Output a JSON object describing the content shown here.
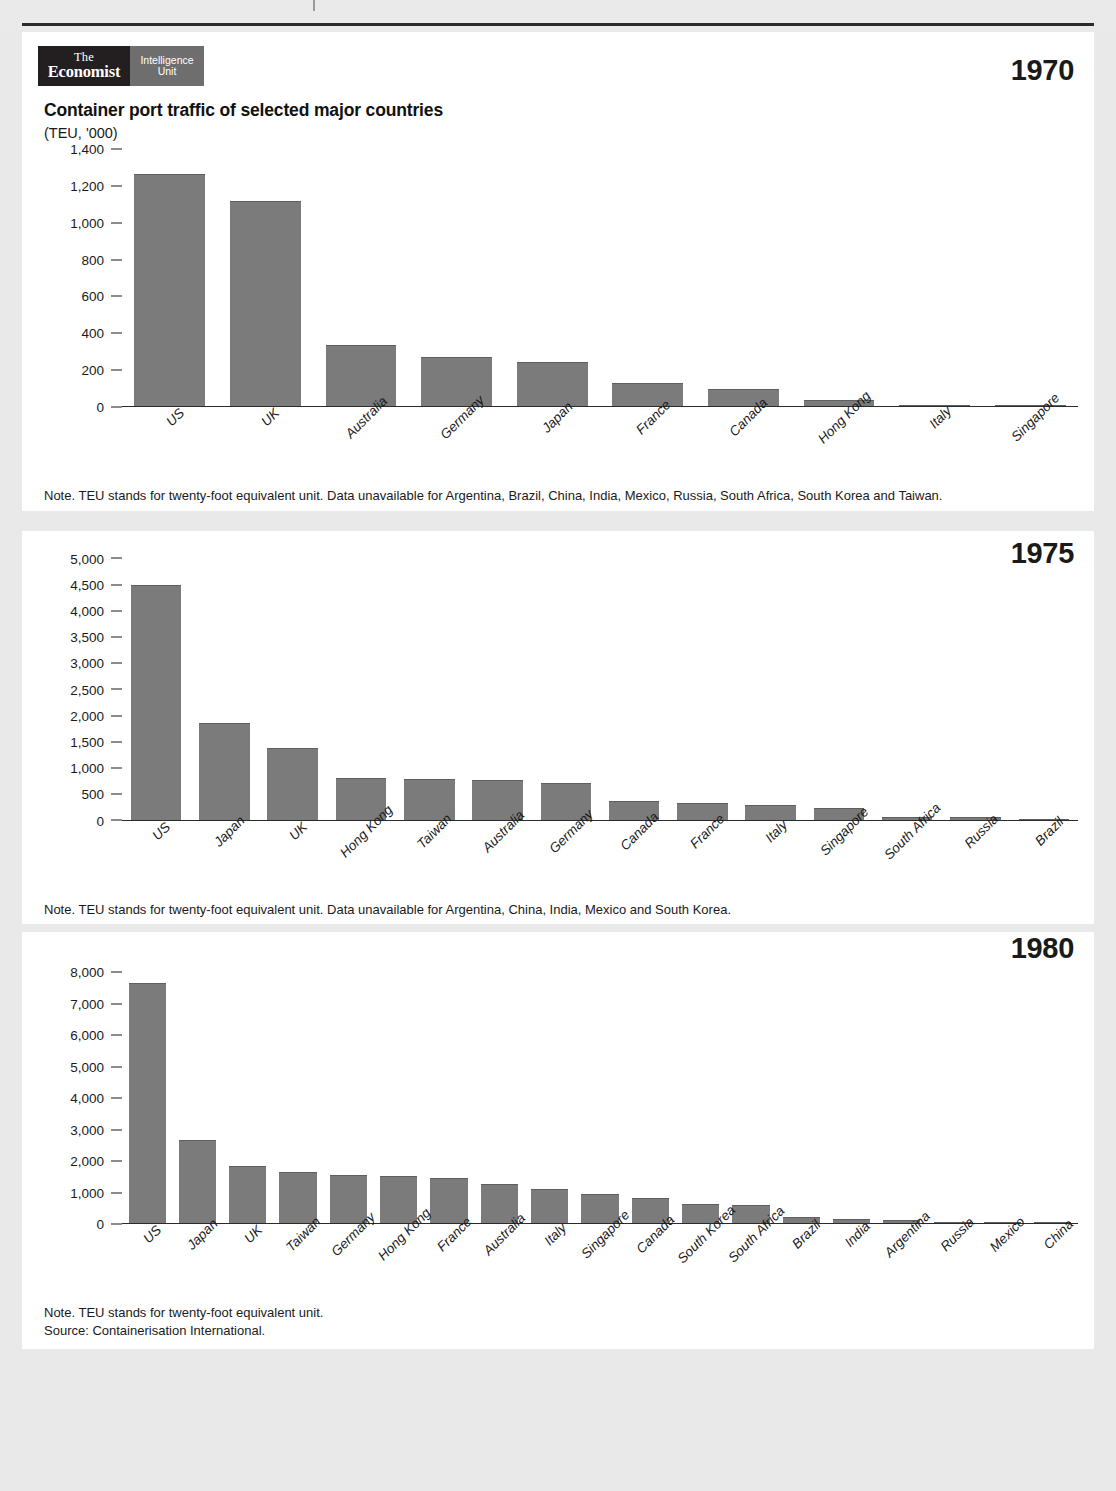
{
  "brand": {
    "economist_line1": "The",
    "economist_line2": "Economist",
    "eiu_line1": "Intelligence",
    "eiu_line2": "Unit",
    "dark_color": "#231f20",
    "gray_color": "#6e6e6e"
  },
  "header": {
    "title": "Container port traffic of selected major countries",
    "subtitle": "(TEU, '000)"
  },
  "panels": [
    {
      "year": "1970",
      "note": "Note. TEU stands for twenty-foot equivalent unit. Data unavailable for Argentina, Brazil, China, India, Mexico, Russia, South Africa, South Korea and Taiwan.",
      "source": ""
    },
    {
      "year": "1975",
      "note": "Note. TEU stands for twenty-foot equivalent unit. Data unavailable for Argentina, China, India, Mexico and South Korea.",
      "source": ""
    },
    {
      "year": "1980",
      "note": "Note. TEU stands for twenty-foot equivalent unit.",
      "source": "Source: Containerisation International."
    }
  ],
  "chart_data": [
    {
      "type": "bar",
      "title": "Container port traffic of selected major countries",
      "subtitle": "(TEU, '000)",
      "year": "1970",
      "xlabel": "",
      "ylabel": "(TEU, '000)",
      "ylim": [
        0,
        1400
      ],
      "yticks": [
        0,
        200,
        400,
        600,
        800,
        1000,
        1200,
        1400
      ],
      "ytick_labels": [
        "0",
        "200",
        "400",
        "600",
        "800",
        "1,000",
        "1,200",
        "1,400"
      ],
      "grid": false,
      "legend": "none",
      "bar_color": "#7b7b7b",
      "categories": [
        "US",
        "UK",
        "Australia",
        "Germany",
        "Japan",
        "France",
        "Canada",
        "Hong Kong",
        "Italy",
        "Singapore"
      ],
      "values": [
        1260,
        1110,
        330,
        265,
        240,
        125,
        90,
        32,
        6,
        2
      ]
    },
    {
      "type": "bar",
      "title": "Container port traffic of selected major countries",
      "subtitle": "(TEU, '000)",
      "year": "1975",
      "xlabel": "",
      "ylabel": "(TEU, '000)",
      "ylim": [
        0,
        5000
      ],
      "yticks": [
        0,
        500,
        1000,
        1500,
        2000,
        2500,
        3000,
        3500,
        4000,
        4500,
        5000
      ],
      "ytick_labels": [
        "0",
        "500",
        "1,000",
        "1,500",
        "2,000",
        "2,500",
        "3,000",
        "3,500",
        "4,000",
        "4,500",
        "5,000"
      ],
      "grid": false,
      "legend": "none",
      "bar_color": "#7b7b7b",
      "categories": [
        "US",
        "Japan",
        "UK",
        "Hong Kong",
        "Taiwan",
        "Australia",
        "Germany",
        "Canada",
        "France",
        "Italy",
        "Singapore",
        "South Africa",
        "Russia",
        "Brazil"
      ],
      "values": [
        4480,
        1850,
        1360,
        790,
        770,
        750,
        700,
        360,
        320,
        280,
        215,
        55,
        45,
        10
      ]
    },
    {
      "type": "bar",
      "title": "Container port traffic of selected major countries",
      "subtitle": "(TEU, '000)",
      "year": "1980",
      "xlabel": "",
      "ylabel": "(TEU, '000)",
      "ylim": [
        0,
        8000
      ],
      "yticks": [
        0,
        1000,
        2000,
        3000,
        4000,
        5000,
        6000,
        7000,
        8000
      ],
      "ytick_labels": [
        "0",
        "1,000",
        "2,000",
        "3,000",
        "4,000",
        "5,000",
        "6,000",
        "7,000",
        "8,000"
      ],
      "grid": false,
      "legend": "none",
      "bar_color": "#7b7b7b",
      "categories": [
        "US",
        "Japan",
        "UK",
        "Taiwan",
        "Germany",
        "Hong Kong",
        "France",
        "Australia",
        "Italy",
        "Singapore",
        "Canada",
        "South Korea",
        "South Africa",
        "Brazil",
        "India",
        "Argentina",
        "Russia",
        "Mexico",
        "China"
      ],
      "values": [
        7620,
        2650,
        1820,
        1620,
        1530,
        1480,
        1430,
        1250,
        1070,
        930,
        810,
        620,
        570,
        190,
        130,
        110,
        45,
        10,
        5
      ]
    }
  ]
}
